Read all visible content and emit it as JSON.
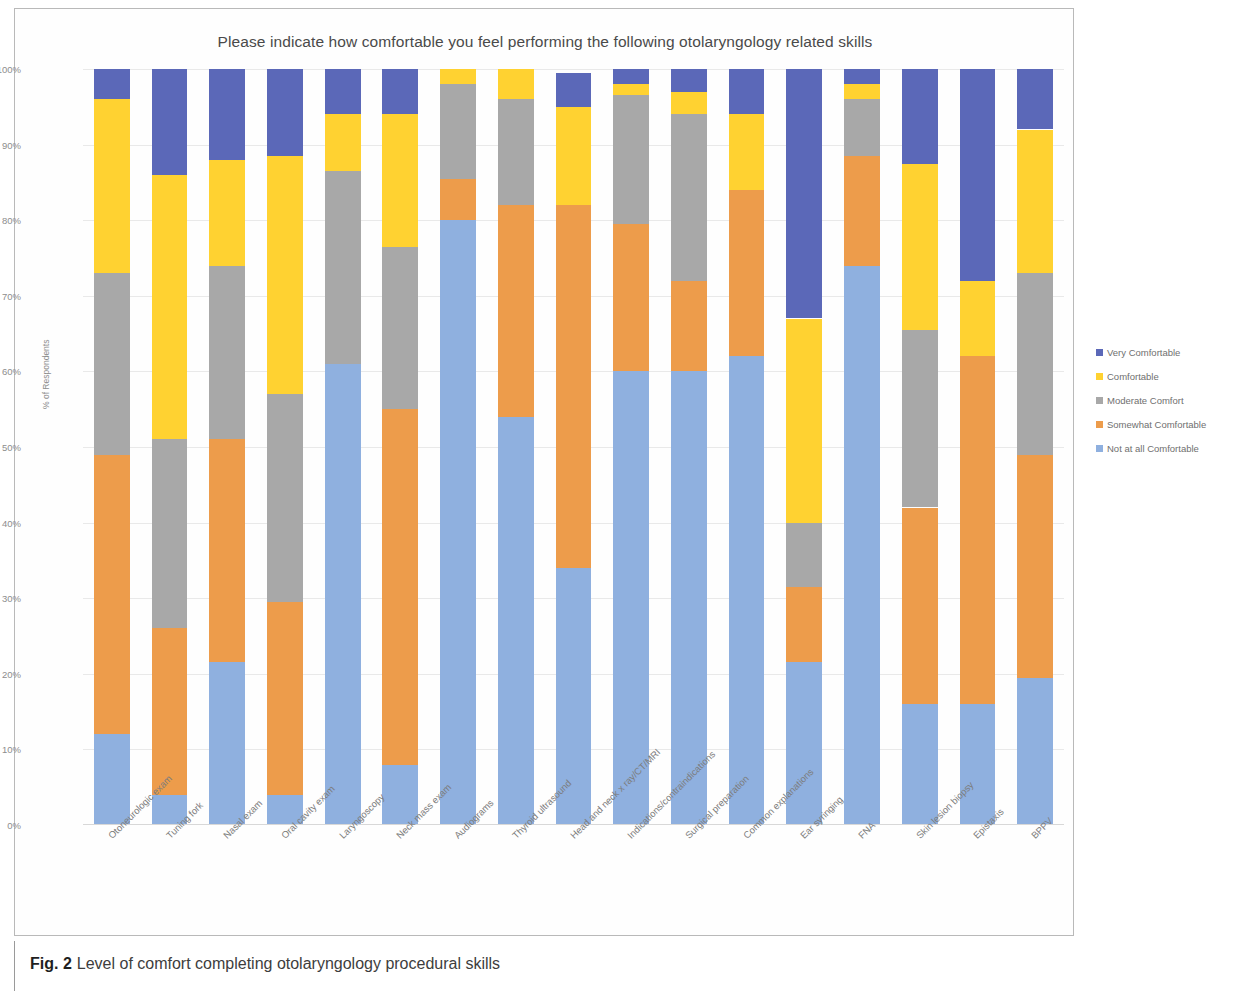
{
  "figure": {
    "caption_label": "Fig. 2",
    "caption_text": "Level of comfort completing otolaryngology procedural skills"
  },
  "chart_data": {
    "type": "bar",
    "subtype": "stacked-100-percent",
    "title": "Please indicate how comfortable you feel performing the following otolaryngology related skills",
    "xlabel": "",
    "ylabel": "% of Respondents",
    "ylim": [
      0,
      100
    ],
    "ytick_labels": [
      "0%",
      "10%",
      "20%",
      "30%",
      "40%",
      "50%",
      "60%",
      "70%",
      "80%",
      "90%",
      "100%"
    ],
    "ytick_values": [
      0,
      10,
      20,
      30,
      40,
      50,
      60,
      70,
      80,
      90,
      100
    ],
    "grid": true,
    "legend_position": "right",
    "stack_order_bottom_to_top": [
      "Not at all Comfortable",
      "Somewhat Comfortable",
      "Moderate Comfort",
      "Comfortable",
      "Very Comfortable"
    ],
    "categories": [
      "Otoneurologic exam",
      "Tuning fork",
      "Nasal exam",
      "Oral cavity exam",
      "Laryngoscopy",
      "Neck mass exam",
      "Audiograms",
      "Thyroid ultrasound",
      "Head and neck x ray/CT/MRI",
      "Indications/contraindications",
      "Surgical preparation",
      "Common explanations",
      "Ear syringing",
      "FNA",
      "Skin lesion biopsy",
      "Epistaxis",
      "BPPV"
    ],
    "series": [
      {
        "name": "Not at all Comfortable",
        "color": "#8FB0DF",
        "values": [
          12,
          4,
          21.5,
          4,
          61,
          8,
          80,
          54,
          34,
          60,
          60,
          62,
          21.5,
          74,
          16,
          16,
          19.5
        ]
      },
      {
        "name": "Somewhat Comfortable",
        "color": "#ED9C4B",
        "values": [
          37,
          22,
          29.5,
          25.5,
          0,
          47,
          5.5,
          28,
          48,
          19.5,
          12,
          22,
          10,
          14.5,
          26,
          46,
          29.5
        ]
      },
      {
        "name": "Moderate Comfort",
        "color": "#A8A8A8",
        "values": [
          24,
          25,
          23,
          27.5,
          25.5,
          21.5,
          12.5,
          14,
          0,
          17,
          22,
          0,
          8.5,
          7.5,
          23.5,
          0,
          24
        ]
      },
      {
        "name": "Comfortable",
        "color": "#FFD231",
        "values": [
          23,
          35,
          14,
          31.5,
          7.5,
          17.5,
          2,
          4,
          13,
          1.5,
          3,
          10,
          27,
          2,
          22,
          10,
          19
        ]
      },
      {
        "name": "Very Comfortable",
        "color": "#5B68B8",
        "values": [
          4,
          14,
          12,
          11.5,
          6,
          6,
          0,
          0,
          4.5,
          2,
          3,
          6,
          33,
          2,
          12.5,
          28,
          8
        ]
      }
    ]
  },
  "legend": {
    "items": [
      {
        "label": "Very Comfortable",
        "color": "#5B68B8"
      },
      {
        "label": "Comfortable",
        "color": "#FFD231"
      },
      {
        "label": "Moderate Comfort",
        "color": "#A8A8A8"
      },
      {
        "label": "Somewhat Comfortable",
        "color": "#ED9C4B"
      },
      {
        "label": "Not at all Comfortable",
        "color": "#8FB0DF"
      }
    ]
  }
}
